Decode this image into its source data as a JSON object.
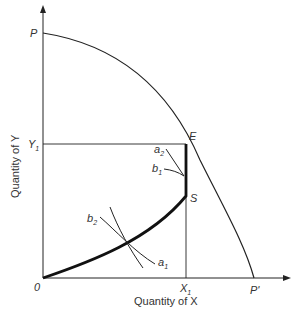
{
  "diagram": {
    "x_axis_label": "Quantity of X",
    "y_axis_label": "Quantity of Y",
    "origin_label": "0",
    "points": {
      "P": "P",
      "P_prime": "P'",
      "E": "E",
      "S": "S",
      "Y1": "Y",
      "Y1_sub": "1",
      "X1": "X",
      "X1_sub": "1"
    },
    "curves": {
      "a1": "a",
      "a1_sub": "1",
      "a2": "a",
      "a2_sub": "2",
      "b1": "b",
      "b1_sub": "1",
      "b2": "b",
      "b2_sub": "2"
    },
    "colors": {
      "ink": "#222222",
      "text": "#333333"
    }
  }
}
